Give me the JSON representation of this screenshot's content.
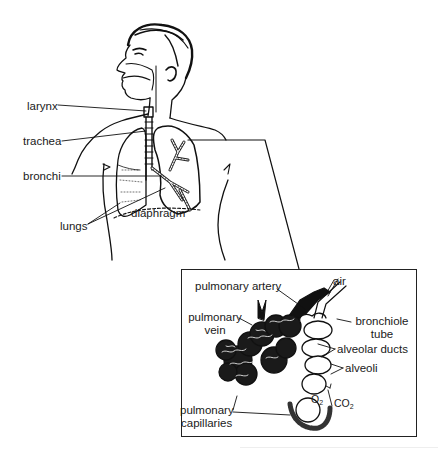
{
  "figure": {
    "main_labels": {
      "larynx": "larynx",
      "trachea": "trachea",
      "bronchi": "bronchi",
      "lungs": "lungs",
      "diaphragm": "diaphragm"
    },
    "inset": {
      "title": "Alveoli detail",
      "labels": {
        "pulmonary_artery": "pulmonary artery",
        "air": "air",
        "pulmonary_vein_1": "pulmonary",
        "pulmonary_vein_2": "vein",
        "bronchiole_tube_1": "bronchiole",
        "bronchiole_tube_2": "tube",
        "alveolar_ducts": "alveolar ducts",
        "alveoli": "alveoli",
        "o2": "O",
        "o2_sub": "2",
        "co2": "CO",
        "co2_sub": "2",
        "pulmonary_capillaries_1": "pulmonary",
        "pulmonary_capillaries_2": "capillaries"
      }
    },
    "colors": {
      "ink": "#111111",
      "background": "#ffffff"
    }
  }
}
